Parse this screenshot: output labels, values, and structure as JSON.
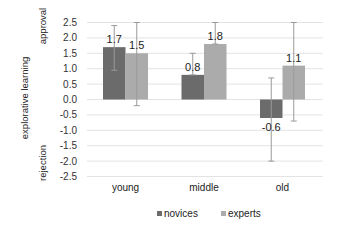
{
  "chart_data": {
    "type": "bar",
    "title": "",
    "xlabel": "",
    "ylabel": "explorative learning",
    "ylabel_top": "approval",
    "ylabel_bottom": "rejection",
    "categories": [
      "young",
      "middle",
      "old"
    ],
    "series": [
      {
        "name": "novices",
        "color": "#6b6b6b",
        "values": [
          1.7,
          0.8,
          -0.6
        ],
        "error_low": [
          0.95,
          0.8,
          -2.0
        ],
        "error_high": [
          2.4,
          1.5,
          0.7
        ]
      },
      {
        "name": "experts",
        "color": "#ababab",
        "values": [
          1.5,
          1.8,
          1.1
        ],
        "error_low": [
          -0.2,
          1.8,
          -0.7
        ],
        "error_high": [
          2.5,
          2.5,
          2.5
        ]
      }
    ],
    "data_labels": [
      [
        "1.7",
        "0.8",
        "-0.6"
      ],
      [
        "1.5",
        "1.8",
        "1.1"
      ]
    ],
    "yticks": [
      2.5,
      2.0,
      1.5,
      1.0,
      0.5,
      0.0,
      -0.5,
      -1.0,
      -1.5,
      -2.0,
      -2.5
    ],
    "ytick_labels": [
      "2.5",
      "2.0",
      "1.5",
      "1.0",
      "0.5",
      "0.0",
      "-0.5",
      "-1.0",
      "-1.5",
      "-2.0",
      "-2.5"
    ],
    "ylim": [
      -2.5,
      2.5
    ],
    "grid": true,
    "legend_position": "bottom"
  }
}
